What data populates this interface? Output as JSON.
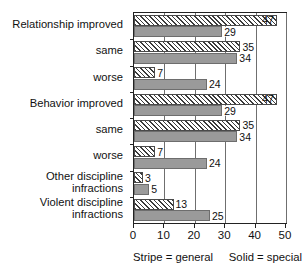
{
  "chart_data": {
    "type": "bar",
    "orientation": "horizontal",
    "title": "",
    "xlabel": "",
    "ylabel": "",
    "xlim": [
      0,
      50
    ],
    "xticks": [
      0,
      10,
      20,
      30,
      40,
      50
    ],
    "grid": true,
    "legend_position": "below-axis",
    "categories": [
      "Relationship improved",
      "same",
      "worse",
      "Behavior improved",
      "same",
      "worse",
      "Other discipline\ninfractions",
      "Violent discipline\ninfractions"
    ],
    "series": [
      {
        "name": "general",
        "pattern": "stripe",
        "values": [
          47,
          35,
          7,
          47,
          35,
          7,
          3,
          13
        ]
      },
      {
        "name": "special",
        "pattern": "solid",
        "values": [
          29,
          34,
          24,
          29,
          34,
          24,
          5,
          25
        ]
      }
    ]
  },
  "legend": {
    "stripe_entry": "Stripe = general",
    "solid_entry": "Solid = special"
  },
  "colors": {
    "stripe_fill": "#ffffff",
    "stripe_hatch": "#3b3b3b",
    "solid_fill": "#9a9a9a",
    "axis": "#222222",
    "gridline": "#6f6f6f",
    "text": "#111111",
    "background": "#ffffff"
  }
}
